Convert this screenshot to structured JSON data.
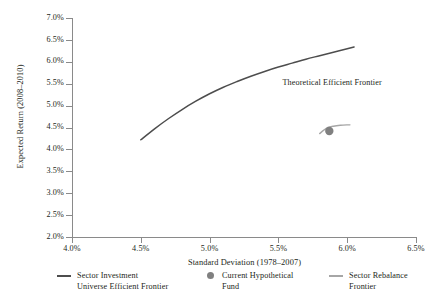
{
  "chart_data": {
    "type": "line",
    "title": "",
    "xlabel": "Standard Deviation (1978–2007)",
    "ylabel": "Expected Return (2008–2010)",
    "xlim": [
      4.0,
      6.5
    ],
    "ylim": [
      2.0,
      7.0
    ],
    "grid": false,
    "legend_position": "bottom",
    "xticks": [
      "4.0%",
      "4.5%",
      "5.0%",
      "5.5%",
      "6.0%",
      "6.5%"
    ],
    "xtick_values": [
      4.0,
      4.5,
      5.0,
      5.5,
      6.0,
      6.5
    ],
    "yticks": [
      "2.0%",
      "2.5%",
      "3.0%",
      "3.5%",
      "4.0%",
      "4.5%",
      "5.0%",
      "5.5%",
      "6.0%",
      "6.5%",
      "7.0%"
    ],
    "ytick_values": [
      2.0,
      2.5,
      3.0,
      3.5,
      4.0,
      4.5,
      5.0,
      5.5,
      6.0,
      6.5,
      7.0
    ],
    "annotations": [
      {
        "text": "Theoretical Efficient Frontier",
        "x": 5.53,
        "y": 5.55
      }
    ],
    "series": [
      {
        "name": "Sector Investment Universe Efficient Frontier",
        "type": "line",
        "color": "#4d4d4d",
        "x": [
          4.5,
          4.6,
          4.7,
          4.8,
          4.9,
          5.0,
          5.1,
          5.2,
          5.3,
          5.4,
          5.5,
          5.6,
          5.7,
          5.8,
          5.9,
          6.0,
          6.05
        ],
        "y": [
          4.22,
          4.47,
          4.7,
          4.91,
          5.1,
          5.27,
          5.42,
          5.55,
          5.67,
          5.78,
          5.88,
          5.97,
          6.06,
          6.14,
          6.22,
          6.3,
          6.34
        ]
      },
      {
        "name": "Sector Rebalance Frontier",
        "type": "line",
        "color": "#a6a6a6",
        "x": [
          5.8,
          5.83,
          5.86,
          5.9,
          5.95,
          6.0,
          6.02
        ],
        "y": [
          4.36,
          4.44,
          4.5,
          4.53,
          4.55,
          4.56,
          4.56
        ]
      },
      {
        "name": "Current Hypothetical Fund",
        "type": "scatter",
        "color": "#808080",
        "x": [
          5.87
        ],
        "y": [
          4.42
        ]
      }
    ]
  },
  "axis": {
    "y_title": "Expected Return (2008–2010)",
    "x_title": "Standard Deviation (1978–2007)"
  },
  "annotation": {
    "efficient_frontier": "Theoretical Efficient Frontier"
  },
  "legend": {
    "items": [
      {
        "marker": "line",
        "color": "#4d4d4d",
        "line1": "Sector Investment",
        "line2": "Universe Efficient Frontier"
      },
      {
        "marker": "dot",
        "color": "#808080",
        "line1": "Current Hypothetical",
        "line2": "Fund"
      },
      {
        "marker": "line-thin",
        "color": "#a6a6a6",
        "line1": "Sector Rebalance",
        "line2": "Frontier"
      }
    ]
  }
}
